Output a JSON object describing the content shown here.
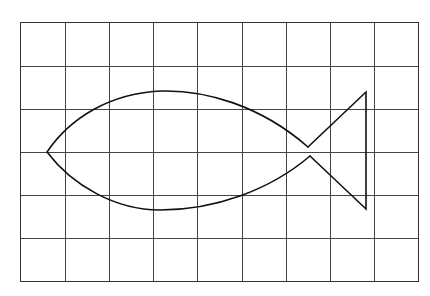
{
  "diagram": {
    "grid": {
      "columns": 9,
      "rows": 6
    },
    "colors": {
      "background": "#ffffff",
      "grid_line": "#444444",
      "outline": "#111111"
    },
    "shape": {
      "name": "fish",
      "parts": [
        "body",
        "tail"
      ]
    }
  }
}
